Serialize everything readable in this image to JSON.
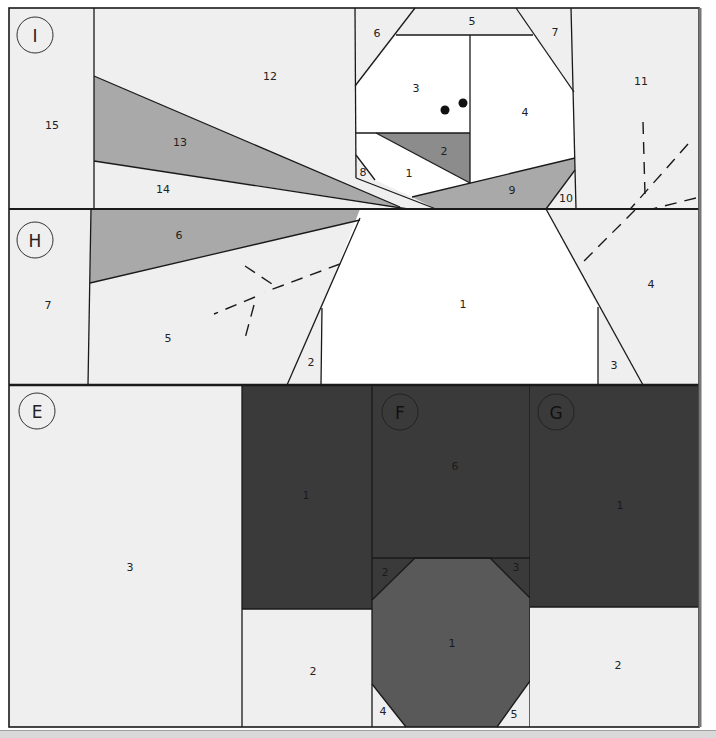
{
  "colors": {
    "light": "#efefef",
    "white": "#ffffff",
    "gray": "#a9a9a9",
    "midgray": "#8c8c8c",
    "dark": "#3a3a3a",
    "hatdark": "#595959",
    "line": "#1a1a1a"
  },
  "sections": {
    "I": {
      "label": "I",
      "pieces": {
        "p1": "1",
        "p2": "2",
        "p3": "3",
        "p4": "4",
        "p5": "5",
        "p6": "6",
        "p7": "7",
        "p8": "8",
        "p9": "9",
        "p10": "10",
        "p11": "11",
        "p12": "12",
        "p13": "13",
        "p14": "14",
        "p15": "15"
      }
    },
    "H": {
      "label": "H",
      "pieces": {
        "p1": "1",
        "p2": "2",
        "p3": "3",
        "p4": "4",
        "p5": "5",
        "p6": "6",
        "p7": "7"
      }
    },
    "E": {
      "label": "E",
      "pieces": {
        "p1": "1",
        "p2": "2",
        "p3": "3"
      }
    },
    "F": {
      "label": "F",
      "pieces": {
        "p1": "1",
        "p2": "2",
        "p3": "3",
        "p4": "4",
        "p5": "5",
        "p6": "6"
      }
    },
    "G": {
      "label": "G",
      "pieces": {
        "p1": "1",
        "p2": "2"
      }
    }
  }
}
